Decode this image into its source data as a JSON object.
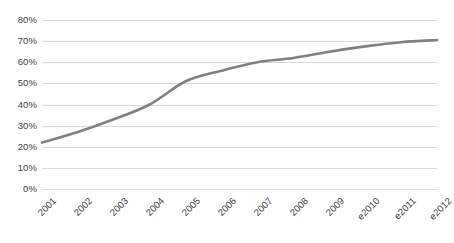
{
  "chart_data": {
    "type": "line",
    "title": "",
    "subtitle": "",
    "xlabel": "",
    "ylabel": "",
    "categories": [
      "2001",
      "2002",
      "2003",
      "2004",
      "2005",
      "2006",
      "2007",
      "2008",
      "2009",
      "e2010",
      "e2011",
      "e2012"
    ],
    "series": [
      {
        "name": "",
        "values": [
          22,
          27,
          33,
          40,
          51,
          56,
          60,
          62,
          65,
          67.5,
          69.5,
          70.5
        ],
        "color": "#808080"
      }
    ],
    "ylim": [
      0,
      80
    ],
    "ytick_step": 10,
    "ytick_labels": [
      "0%",
      "10%",
      "20%",
      "30%",
      "40%",
      "50%",
      "60%",
      "70%",
      "80%"
    ],
    "ytick_values": [
      0,
      10,
      20,
      30,
      40,
      50,
      60,
      70,
      80
    ],
    "value_suffix": "%",
    "grid": {
      "horizontal": true,
      "vertical": false,
      "color": "#d9d9d9"
    },
    "legend": {
      "visible": false,
      "position": "none",
      "entries": []
    },
    "axis": {
      "x_label_rotation_deg": -45,
      "show_axis_line": false,
      "show_markers": false
    },
    "colors": {
      "background": "#ffffff",
      "gridline": "#d9d9d9",
      "text": "#404040",
      "series_line": "#808080"
    }
  }
}
